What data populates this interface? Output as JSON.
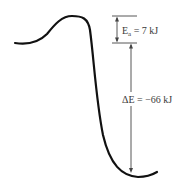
{
  "diagram": {
    "type": "energy-profile",
    "colors": {
      "curve": "#111111",
      "guide_lines": "#444444",
      "text": "#3a3a3a",
      "background": "#ffffff"
    },
    "activation_energy": {
      "symbol": "E",
      "subscript": "a",
      "value_text": " = 7 kJ",
      "value_kj": 7
    },
    "energy_change": {
      "label": "ΔE = −66 kJ",
      "value_kj": -66
    }
  }
}
